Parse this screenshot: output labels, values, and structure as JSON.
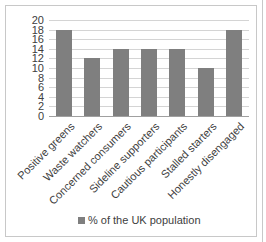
{
  "chart_data": {
    "type": "bar",
    "title": "",
    "xlabel": "",
    "ylabel": "",
    "ylim": [
      0,
      20
    ],
    "yticks": [
      "20",
      "18",
      "16",
      "14",
      "12",
      "10",
      "8",
      "6",
      "4",
      "2",
      "0"
    ],
    "grid": true,
    "legend_position": "bottom",
    "categories": [
      "Positive greens",
      "Waste watchers",
      "Concerned consumers",
      "Sideline supporters",
      "Cautious participants",
      "Stalled starters",
      "Honestly disengaged"
    ],
    "series": [
      {
        "name": "% of the UK population",
        "values": [
          18,
          12,
          14,
          14,
          14,
          10,
          18
        ],
        "color": "#7f7f7f"
      }
    ]
  },
  "legend": {
    "label": "% of the UK population"
  }
}
